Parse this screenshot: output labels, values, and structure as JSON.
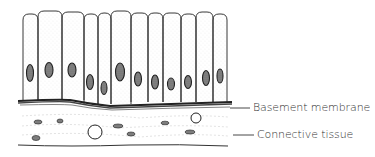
{
  "diagram": {
    "labels": [
      {
        "id": "basement-membrane",
        "text": "Basement membrane",
        "x": 253,
        "y": 101,
        "line_x1": 230,
        "line_x2": 250,
        "line_y": 108
      },
      {
        "id": "connective-tissue",
        "text": "Connective tissue",
        "x": 257,
        "y": 128,
        "line_x1": 233,
        "line_x2": 254,
        "line_y": 135
      }
    ],
    "cells": [
      {
        "x": 23,
        "w": 15,
        "top": 14,
        "nx": 30,
        "ny": 73,
        "nw": 7,
        "nh": 17
      },
      {
        "x": 38,
        "w": 24,
        "top": 11,
        "nx": 49,
        "ny": 70,
        "nw": 8,
        "nh": 15
      },
      {
        "x": 62,
        "w": 22,
        "top": 12,
        "nx": 72,
        "ny": 70,
        "nw": 8,
        "nh": 14
      },
      {
        "x": 84,
        "w": 14,
        "top": 14,
        "nx": 90,
        "ny": 82,
        "nw": 7,
        "nh": 15
      },
      {
        "x": 98,
        "w": 13,
        "top": 13,
        "nx": 104,
        "ny": 88,
        "nw": 6,
        "nh": 13
      },
      {
        "x": 111,
        "w": 20,
        "top": 11,
        "nx": 120,
        "ny": 72,
        "nw": 9,
        "nh": 18
      },
      {
        "x": 131,
        "w": 17,
        "top": 13,
        "nx": 138,
        "ny": 79,
        "nw": 7,
        "nh": 14
      },
      {
        "x": 148,
        "w": 15,
        "top": 13,
        "nx": 155,
        "ny": 82,
        "nw": 7,
        "nh": 14
      },
      {
        "x": 163,
        "w": 18,
        "top": 13,
        "nx": 171,
        "ny": 84,
        "nw": 7,
        "nh": 12
      },
      {
        "x": 181,
        "w": 15,
        "top": 14,
        "nx": 188,
        "ny": 82,
        "nw": 7,
        "nh": 13
      },
      {
        "x": 196,
        "w": 17,
        "top": 12,
        "nx": 206,
        "ny": 78,
        "nw": 7,
        "nh": 15
      },
      {
        "x": 213,
        "w": 14,
        "top": 14,
        "nx": 220,
        "ny": 76,
        "nw": 6,
        "nh": 14
      }
    ],
    "connective_nuclei": [
      {
        "cx": 38,
        "cy": 122,
        "rx": 4,
        "ry": 2
      },
      {
        "cx": 60,
        "cy": 121,
        "rx": 3,
        "ry": 2
      },
      {
        "cx": 36,
        "cy": 138,
        "rx": 4,
        "ry": 2.5
      },
      {
        "cx": 118,
        "cy": 126,
        "rx": 5,
        "ry": 2
      },
      {
        "cx": 131,
        "cy": 134,
        "rx": 4,
        "ry": 2
      },
      {
        "cx": 165,
        "cy": 123,
        "rx": 4,
        "ry": 1.8
      },
      {
        "cx": 190,
        "cy": 132,
        "rx": 5,
        "ry": 2
      }
    ],
    "round_cells": [
      {
        "cx": 95,
        "cy": 132,
        "r": 7
      },
      {
        "cx": 196,
        "cy": 118,
        "r": 5
      }
    ],
    "colors": {
      "ink": "#222222",
      "stipple": "#9a9a9a",
      "background": "#ffffff"
    }
  }
}
